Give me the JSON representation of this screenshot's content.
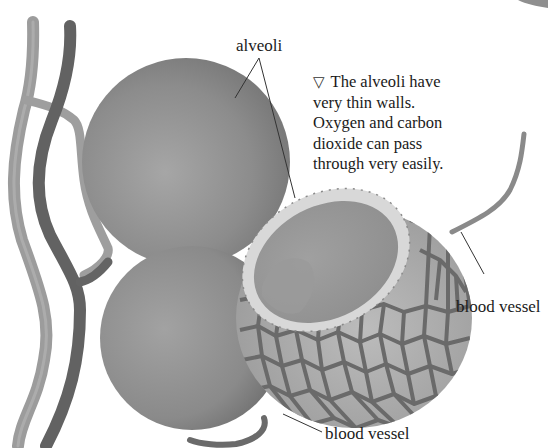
{
  "figure": {
    "type": "illustration",
    "palette": {
      "background": "#ffffff",
      "sphere": "#8a8a8a",
      "sphere_highlight": "#a4a4a4",
      "vessel_light": "#9a9a9a",
      "vessel_dark": "#5e5e5e",
      "capillary_net": "#6e6e6e",
      "cell_fill": "#b0b0b0",
      "rim": "#d6d6d6",
      "text": "#1a1a1a",
      "leader_line": "#333333"
    }
  },
  "labels": {
    "alveoli": "alveoli",
    "blood_vessel_right": "blood vessel",
    "blood_vessel_bottom": "blood vessel"
  },
  "caption": {
    "marker": "▽",
    "lines": [
      "The alveoli have",
      "very thin walls.",
      "Oxygen and carbon",
      "dioxide can pass",
      "through very easily."
    ]
  }
}
